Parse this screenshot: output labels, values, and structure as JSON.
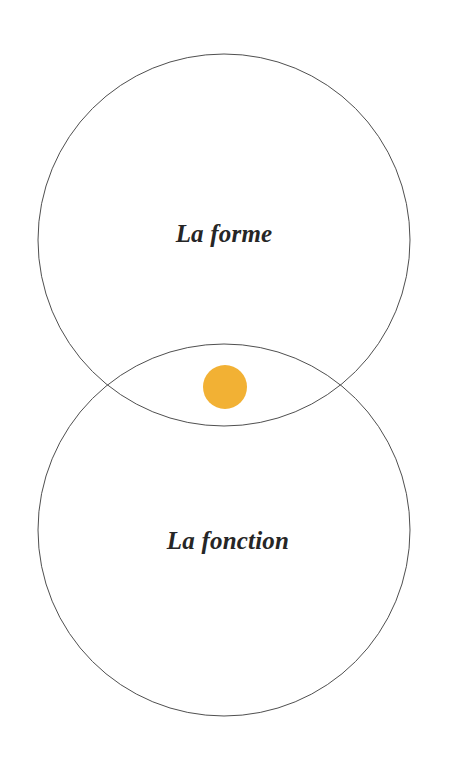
{
  "page": {
    "background_color": "#ffffff",
    "width": 455,
    "height": 766
  },
  "diagram": {
    "type": "venn-two-set",
    "stroke_color": "#4f4f4f",
    "stroke_width": 1,
    "fill": "none",
    "sets": [
      {
        "id": "forme",
        "label": "La forme",
        "position": "top",
        "center_x": 224,
        "center_y": 240,
        "radius": 186,
        "label_x": 224,
        "label_y": 242
      },
      {
        "id": "fonction",
        "label": "La fonction",
        "position": "bottom",
        "center_x": 224,
        "center_y": 530,
        "radius": 186,
        "label_x": 228,
        "label_y": 549
      }
    ],
    "intersection": {
      "id": "intersection-dot",
      "shape": "circle",
      "color": "#f2b134",
      "center_x": 225,
      "center_y": 387,
      "radius": 22,
      "label": ""
    }
  },
  "chart_data": {
    "type": "venn",
    "categories": [
      "La forme",
      "La fonction"
    ],
    "sets": [
      {
        "name": "La forme",
        "cx": 224,
        "cy": 240,
        "r": 186
      },
      {
        "name": "La fonction",
        "cx": 224,
        "cy": 530,
        "r": 186
      }
    ],
    "highlight": {
      "name": "intersection",
      "cx": 225,
      "cy": 387,
      "r": 22,
      "color": "#f2b134"
    },
    "legend": "none",
    "grid": false
  }
}
